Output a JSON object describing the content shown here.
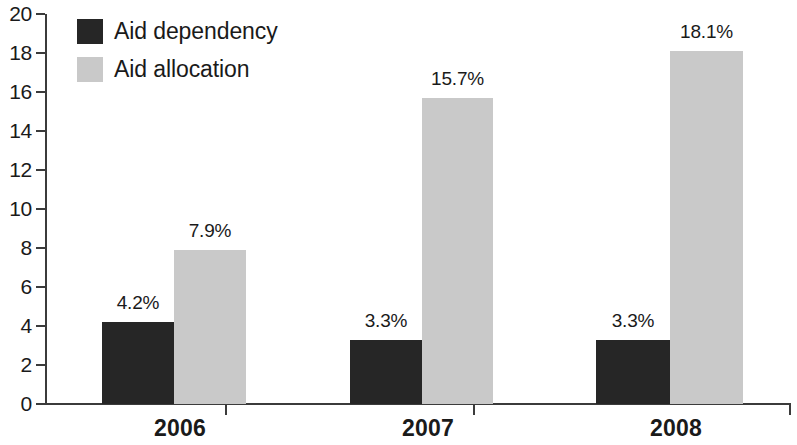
{
  "chart_data": {
    "type": "bar",
    "title": "",
    "subtitle": "",
    "xlabel": "",
    "ylabel": "",
    "categories": [
      "2006",
      "2007",
      "2008"
    ],
    "series": [
      {
        "name": "Aid dependency",
        "color": "#262626",
        "values": [
          4.2,
          3.3,
          3.3
        ],
        "value_labels": [
          "4.2%",
          "3.3%",
          "3.3%"
        ]
      },
      {
        "name": "Aid allocation",
        "color": "#c9c9c9",
        "values": [
          7.9,
          15.7,
          18.1
        ],
        "value_labels": [
          "7.9%",
          "15.7%",
          "18.1%"
        ]
      }
    ],
    "ylim": [
      0,
      20
    ],
    "y_ticks": [
      0,
      2,
      4,
      6,
      8,
      10,
      12,
      14,
      16,
      18,
      20
    ],
    "y_tick_labels": [
      "0",
      "2",
      "4",
      "6",
      "8",
      "10",
      "12",
      "14",
      "16",
      "18",
      "20"
    ],
    "grid": false,
    "legend_position": "top-left"
  },
  "legend": {
    "items": [
      {
        "label": "Aid dependency",
        "swatch": "dark-square-swatch"
      },
      {
        "label": "Aid allocation",
        "swatch": "light-square-swatch"
      }
    ]
  },
  "axis": {
    "y_tick_labels": [
      "20",
      "18",
      "16",
      "14",
      "12",
      "10",
      "8",
      "6",
      "4",
      "2",
      "0"
    ],
    "x_tick_labels": [
      "2006",
      "2007",
      "2008"
    ]
  }
}
